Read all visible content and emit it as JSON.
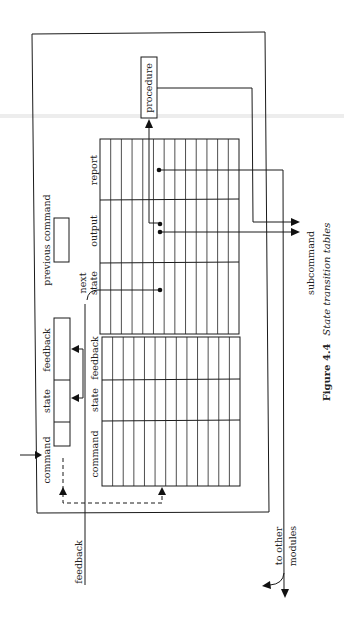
{
  "figure": {
    "number_label": "Figure 4.4",
    "title": "State transition tables"
  },
  "labels": {
    "procedure": "procedure",
    "report": "report",
    "output": "output",
    "next_state_1": "next",
    "next_state_2": "state",
    "previous_command": "previous command",
    "table_feedback": "feedback",
    "table_state": "state",
    "table_command": "command",
    "reg_feedback": "feedback",
    "reg_state": "state",
    "reg_command": "command",
    "feedback_input": "feedback",
    "subcommand": "subcommand",
    "to_other_1": "to other",
    "to_other_2": "modules"
  },
  "table": {
    "columns": 13,
    "upper_sections": [
      "report",
      "output",
      "next state"
    ],
    "lower_sections": [
      "feedback",
      "state",
      "command"
    ]
  },
  "colors": {
    "ink": "#1a1a1a",
    "paper": "#ffffff"
  }
}
